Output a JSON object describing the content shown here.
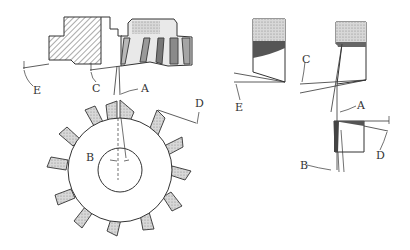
{
  "diagram": {
    "views": {
      "section_view": {
        "labels": [
          "E",
          "C",
          "A"
        ]
      },
      "face_view": {
        "labels": [
          "B",
          "D"
        ]
      },
      "tooth_detail_left": {
        "labels": [
          "E"
        ]
      },
      "tooth_detail_right": {
        "labels": [
          "C",
          "A",
          "B",
          "D"
        ]
      }
    },
    "labels": {
      "left_E": "E",
      "left_C": "C",
      "left_A": "A",
      "left_D": "D",
      "left_B": "B",
      "right_C": "C",
      "right_E": "E",
      "right_A": "A",
      "right_B": "B",
      "right_D": "D"
    },
    "colors": {
      "line": "#333333",
      "hatch": "#555555",
      "shade": "#bdbdbd",
      "dark_shade": "#666666",
      "background": "#ffffff"
    }
  }
}
